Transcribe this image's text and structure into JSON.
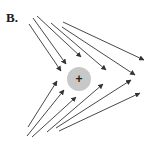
{
  "figure": {
    "panel_label": "B.",
    "charge": {
      "sign": "+",
      "cx": 79,
      "cy": 79,
      "r": 12,
      "fill": "#c8c8c8",
      "sign_color": "#222222"
    },
    "arrow_color": "#333333",
    "arrows": [
      {
        "group": "upper",
        "x1": 29,
        "y1": 24,
        "x2": 61,
        "y2": 71
      },
      {
        "group": "upper",
        "x1": 33,
        "y1": 18,
        "x2": 66,
        "y2": 64
      },
      {
        "group": "upper",
        "x1": 37,
        "y1": 16,
        "x2": 81,
        "y2": 57
      },
      {
        "group": "upper",
        "x1": 51,
        "y1": 23,
        "x2": 106,
        "y2": 70
      },
      {
        "group": "upper",
        "x1": 62,
        "y1": 27,
        "x2": 135,
        "y2": 75
      },
      {
        "group": "upper",
        "x1": 63,
        "y1": 22,
        "x2": 144,
        "y2": 60
      },
      {
        "group": "lower",
        "x1": 28,
        "y1": 127,
        "x2": 57,
        "y2": 81
      },
      {
        "group": "lower",
        "x1": 27,
        "y1": 136,
        "x2": 64,
        "y2": 90
      },
      {
        "group": "lower",
        "x1": 32,
        "y1": 137,
        "x2": 76,
        "y2": 97
      },
      {
        "group": "lower",
        "x1": 47,
        "y1": 132,
        "x2": 103,
        "y2": 84
      },
      {
        "group": "lower",
        "x1": 56,
        "y1": 128,
        "x2": 131,
        "y2": 80
      },
      {
        "group": "lower",
        "x1": 59,
        "y1": 131,
        "x2": 140,
        "y2": 93
      }
    ]
  }
}
